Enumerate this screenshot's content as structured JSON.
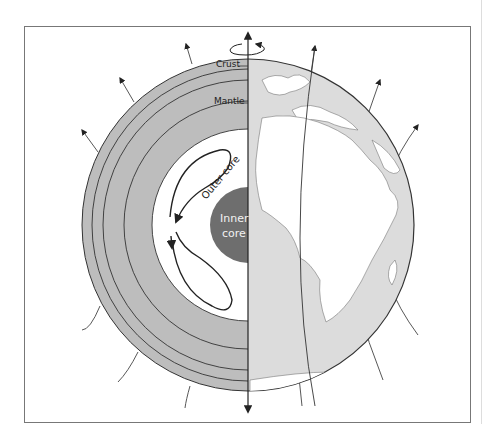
{
  "diagram": {
    "labels": {
      "crust": "Crust",
      "mantle": "Mantle",
      "outer_core": "Outer core",
      "inner_core_line1": "Inner",
      "inner_core_line2": "core"
    },
    "colors": {
      "mantle_fill": "#bdbdbd",
      "outer_core_fill": "#ffffff",
      "inner_core_fill": "#6e6e6e",
      "ocean_fill": "#dcdcdc",
      "land_fill": "#ffffff",
      "line": "#333333",
      "frame_border": "#777777"
    },
    "icons": [
      "rotation-arrow-icon",
      "field-line-arrow-icon"
    ]
  }
}
